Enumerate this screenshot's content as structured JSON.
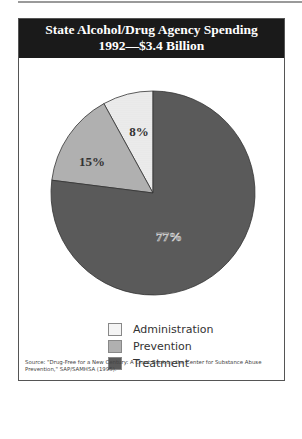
{
  "title": {
    "line1": "State Alcohol/Drug Agency Spending",
    "line2": "1992—$3.4 Billion"
  },
  "chart_data": {
    "type": "pie",
    "title": "State Alcohol/Drug Agency Spending 1992—$3.4 Billion",
    "total": "$3.4 Billion",
    "year": 1992,
    "categories": [
      "Administration",
      "Prevention",
      "Treatment"
    ],
    "values": [
      8,
      15,
      77
    ],
    "unit": "%",
    "labels": [
      "8%",
      "15%",
      "77%"
    ],
    "colors": [
      "#f4f4f4",
      "#b0b0b0",
      "#5a5a5a"
    ],
    "legend_position": "bottom"
  },
  "legend": {
    "items": [
      {
        "label": "Administration"
      },
      {
        "label": "Prevention"
      },
      {
        "label": "Treatment"
      }
    ]
  },
  "source": "Source: \"Drug-Free for a New Century: A Chart Book by the Center for Substance Abuse Prevention,\" SAP/SAMHSA (1995)."
}
